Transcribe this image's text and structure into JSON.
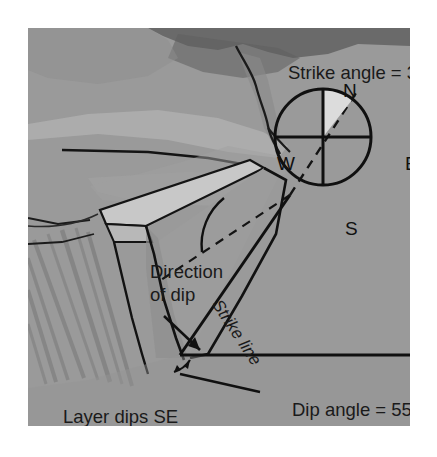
{
  "figure": {
    "background_color": "#9a9a9a",
    "labels": {
      "strike_angle": "Strike angle = 38°",
      "dip_angle": "Dip angle = 55°",
      "layer_dips": "Layer dips SE",
      "direction_of_dip_line1": "Direction",
      "direction_of_dip_line2": "of dip",
      "strike_line": "Strike line"
    },
    "compass": {
      "north": "N",
      "east": "E",
      "south": "S",
      "west": "W",
      "center_x": 295,
      "center_y": 109,
      "radius": 48,
      "strike_bearing_deg": 38,
      "wedge_color": "#dcdcdc"
    },
    "measurements": {
      "strike_angle_deg": 38,
      "dip_angle_deg": 55,
      "dip_direction": "SE"
    },
    "colors": {
      "ground": "#9a9a9a",
      "water_dark": "#6a6a6a",
      "highland_light": "#b2b2b2",
      "scarp_light": "#c4c4c4",
      "bedding_plane": "#9e9e9e",
      "slope_shade": "#8e8e8e",
      "line": "#111111",
      "text": "#1a1a1a"
    }
  }
}
